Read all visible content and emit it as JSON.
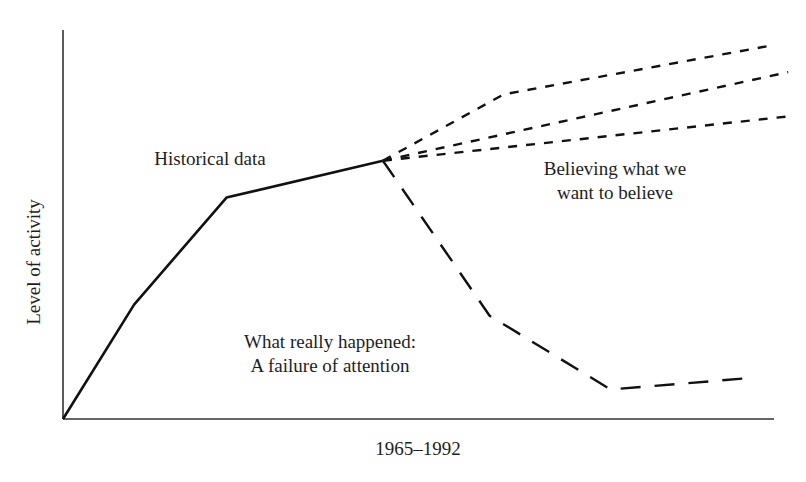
{
  "chart_data": {
    "type": "line",
    "title": "",
    "xlabel": "1965–1992",
    "ylabel": "Level of activity",
    "grid": false,
    "legend": "none",
    "axis_ranges": {
      "x": [
        0,
        100
      ],
      "y": [
        0,
        100
      ]
    },
    "annotations": [
      {
        "id": "historical",
        "lines": [
          "Historical data"
        ],
        "x": 210,
        "y": 165
      },
      {
        "id": "believing",
        "lines": [
          "Believing what we",
          "want to believe"
        ],
        "x": 615,
        "y": 175
      },
      {
        "id": "really",
        "lines": [
          "What really happened:",
          "A failure of attention"
        ],
        "x": 330,
        "y": 348
      }
    ],
    "series": [
      {
        "name": "Historical data",
        "style": "solid",
        "points": [
          [
            0,
            0
          ],
          [
            10,
            31
          ],
          [
            23,
            60
          ],
          [
            45,
            70
          ]
        ]
      },
      {
        "name": "Believing what we want to believe (high)",
        "style": "short-dash",
        "points": [
          [
            45,
            70
          ],
          [
            62,
            88
          ],
          [
            99,
            101
          ]
        ]
      },
      {
        "name": "Believing what we want to believe (middle)",
        "style": "short-dash",
        "points": [
          [
            45,
            70
          ],
          [
            102,
            94
          ]
        ]
      },
      {
        "name": "Believing what we want to believe (low)",
        "style": "short-dash",
        "points": [
          [
            45,
            70
          ],
          [
            102,
            82
          ]
        ]
      },
      {
        "name": "What really happened: A failure of attention",
        "style": "long-dash",
        "points": [
          [
            45,
            70
          ],
          [
            60,
            28
          ],
          [
            77,
            8
          ],
          [
            96,
            11
          ]
        ]
      }
    ]
  },
  "plot_area": {
    "origin_px": [
      63,
      419
    ],
    "x_end_px": 774,
    "y_top_px": 30
  },
  "colors": {
    "line": "#111111",
    "axis": "#333333",
    "text": "#1e1e1e",
    "background": "#ffffff"
  }
}
